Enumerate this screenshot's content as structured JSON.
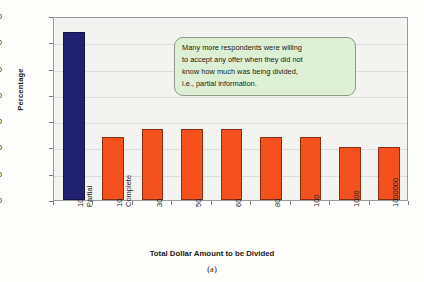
{
  "chart_data": {
    "type": "bar",
    "title": "",
    "xlabel": "Total Dollar Amount to be Divided",
    "ylabel": "Percentage",
    "ylim": [
      0,
      70
    ],
    "yticks": [
      0,
      10,
      20,
      30,
      40,
      50,
      60,
      70
    ],
    "grid": true,
    "legend": "none",
    "categories": [
      "10 Partial",
      "10 Complete",
      "30",
      "50",
      "60",
      "80",
      "100",
      "1000",
      "1000000"
    ],
    "category_lines": [
      [
        "10",
        "Partial"
      ],
      [
        "10",
        "Complete"
      ],
      [
        "30",
        ""
      ],
      [
        "50",
        ""
      ],
      [
        "60",
        ""
      ],
      [
        "80",
        ""
      ],
      [
        "100",
        ""
      ],
      [
        "1000",
        ""
      ],
      [
        "1000000",
        ""
      ]
    ],
    "values": [
      64,
      24,
      27,
      27,
      27,
      24,
      24,
      20,
      20
    ],
    "bar_colors": [
      "#212171",
      "#f4511e",
      "#f4511e",
      "#f4511e",
      "#f4511e",
      "#f4511e",
      "#f4511e",
      "#f4511e",
      "#f4511e"
    ]
  },
  "annotation": {
    "lines": [
      "Many more respondents were willing",
      "to accept any offer when they did not",
      "know how much was being divided,",
      "i.e., partial information."
    ]
  },
  "caption": {
    "text": "(a)"
  },
  "colors": {
    "bar_primary": "#212171",
    "bar_secondary": "#f4511e",
    "plot_background": "#f3f4f2",
    "gridline": "#dcdedb",
    "callout_fill": "#ddf0d5",
    "callout_border": "#8f9a8c",
    "axis": "#9a9a9a"
  }
}
